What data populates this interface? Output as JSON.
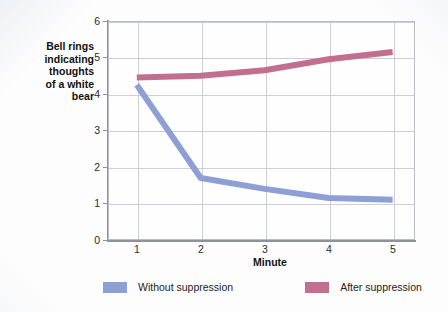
{
  "chart_data": {
    "type": "line",
    "title": "",
    "xlabel": "Minute",
    "ylabel": "Bell rings\nindicating\nthoughts\nof a white\nbear",
    "x": [
      1,
      2,
      3,
      4,
      5
    ],
    "xtick_labels": [
      "1",
      "2",
      "3",
      "4",
      "5"
    ],
    "ytick_labels": [
      "0",
      "1",
      "2",
      "3",
      "4",
      "5",
      "6"
    ],
    "xlim": [
      0.55,
      5.35
    ],
    "ylim": [
      0,
      6
    ],
    "grid": "both",
    "legend_position": "bottom",
    "series": [
      {
        "name": "Without suppression",
        "color": "#8e9fd6",
        "values": [
          4.25,
          1.7,
          1.4,
          1.15,
          1.1
        ]
      },
      {
        "name": "After suppression",
        "color": "#c26f8d",
        "values": [
          4.45,
          4.5,
          4.65,
          4.95,
          5.15
        ]
      }
    ]
  },
  "legend": {
    "items": [
      {
        "label": "Without suppression",
        "color": "#8e9fd6"
      },
      {
        "label": "After suppression",
        "color": "#c26f8d"
      }
    ]
  }
}
